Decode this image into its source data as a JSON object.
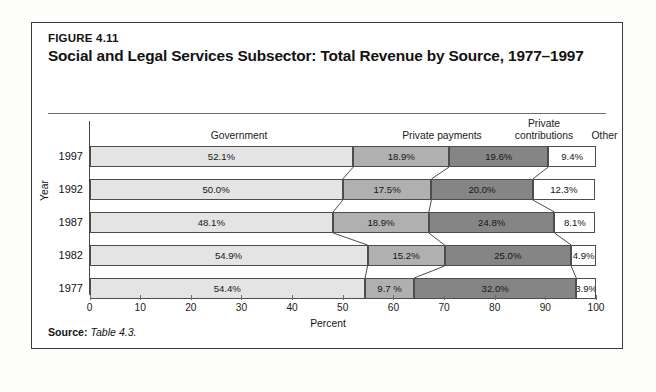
{
  "figure": {
    "label": "FIGURE 4.11",
    "title": "Social and Legal Services Subsector: Total Revenue by Source, 1977–1997",
    "source_prefix": "Source:",
    "source_text": "Table 4.3."
  },
  "chart_data": {
    "type": "bar",
    "orientation": "horizontal",
    "stacked": true,
    "title": "Social and Legal Services Subsector: Total Revenue by Source, 1977–1997",
    "xlabel": "Percent",
    "ylabel": "Year",
    "xlim": [
      0,
      100
    ],
    "grid": false,
    "legend_position": "top-as-column-headers",
    "categories": [
      "1997",
      "1992",
      "1987",
      "1982",
      "1977"
    ],
    "xticks": [
      0,
      10,
      20,
      30,
      40,
      50,
      60,
      70,
      80,
      90,
      100
    ],
    "xtick_labels": [
      "0",
      "10",
      "20",
      "30",
      "40",
      "50",
      "60",
      "70",
      "80",
      "90",
      "100"
    ],
    "series": [
      {
        "name": "Government",
        "color": "#e4e4e4",
        "values": [
          52.1,
          50.0,
          48.1,
          54.9,
          54.4
        ],
        "labels": [
          "52.1%",
          "50.0%",
          "48.1%",
          "54.9%",
          "54.4%"
        ]
      },
      {
        "name": "Private payments",
        "color": "#b0b0b0",
        "values": [
          18.9,
          17.5,
          18.9,
          15.2,
          9.7
        ],
        "labels": [
          "18.9%",
          "17.5%",
          "18.9%",
          "15.2%",
          "9.7 %"
        ]
      },
      {
        "name": "Private contributions",
        "color": "#858585",
        "values": [
          19.6,
          20.0,
          24.8,
          25.0,
          32.0
        ],
        "labels": [
          "19.6%",
          "20.0%",
          "24.8%",
          "25.0%",
          "32.0%"
        ]
      },
      {
        "name": "Other",
        "color": "#ffffff",
        "values": [
          9.4,
          12.3,
          8.1,
          4.9,
          3.9
        ],
        "labels": [
          "9.4%",
          "12.3%",
          "8.1%",
          "4.9%",
          "3.9%"
        ]
      }
    ]
  },
  "column_headers": [
    {
      "line1": "Government",
      "line2": ""
    },
    {
      "line1": "Private payments",
      "line2": ""
    },
    {
      "line1": "Private",
      "line2": "contributions"
    },
    {
      "line1": "Other",
      "line2": ""
    }
  ]
}
